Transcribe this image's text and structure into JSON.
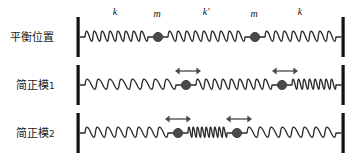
{
  "figure": {
    "title_alt": "Two-mass three-spring coupled oscillator normal modes",
    "width": 361,
    "height": 160,
    "background": "#ffffff",
    "colors": {
      "wall": "#111111",
      "spring": "#2b2b2b",
      "mass": "#4a4a4a",
      "arrow": "#4a4a4a",
      "text": "#1a1a1a"
    }
  },
  "rows": [
    {
      "id": "equilibrium",
      "label": "平衡位置",
      "label_main": "平衡位置",
      "label_sub": "",
      "baseline_y": 37,
      "masses": [
        {
          "name": "mass-left",
          "cx": 158,
          "r": 4.6,
          "label": "m",
          "label_x": 157,
          "label_y": 17,
          "arrow": null
        },
        {
          "name": "mass-right",
          "cx": 255,
          "r": 4.6,
          "label": "m",
          "label_x": 254,
          "label_y": 17,
          "arrow": null
        }
      ],
      "springs": [
        {
          "name": "spring-left",
          "x1": 80,
          "x2": 153,
          "coils": 8,
          "label": "k",
          "label_x": 115,
          "label_y": 15
        },
        {
          "name": "spring-middle",
          "x1": 163,
          "x2": 250,
          "coils": 9,
          "label": "k'",
          "label_x": 206,
          "label_y": 15
        },
        {
          "name": "spring-right",
          "x1": 260,
          "x2": 341,
          "coils": 8,
          "label": "k",
          "label_x": 300,
          "label_y": 15
        }
      ]
    },
    {
      "id": "normal-mode-1",
      "label": "简正模1",
      "label_main": "简正模",
      "label_sub": "1",
      "baseline_y": 85,
      "masses": [
        {
          "name": "mass-left",
          "cx": 186,
          "r": 4.6,
          "label": "",
          "label_x": 0,
          "label_y": 0,
          "arrow": {
            "name": "displacement-arrow-left",
            "x1": 175,
            "x2": 201,
            "y": 71,
            "direction": "both"
          }
        },
        {
          "name": "mass-right",
          "cx": 282,
          "r": 4.6,
          "label": "",
          "label_x": 0,
          "label_y": 0,
          "arrow": {
            "name": "displacement-arrow-right",
            "x1": 272,
            "x2": 298,
            "y": 71,
            "direction": "both"
          }
        }
      ],
      "springs": [
        {
          "name": "spring-left",
          "x1": 80,
          "x2": 181,
          "coils": 8,
          "label": "",
          "label_x": 0,
          "label_y": 0
        },
        {
          "name": "spring-middle",
          "x1": 191,
          "x2": 277,
          "coils": 9,
          "label": "",
          "label_x": 0,
          "label_y": 0
        },
        {
          "name": "spring-right",
          "x1": 287,
          "x2": 341,
          "coils": 8,
          "label": "",
          "label_x": 0,
          "label_y": 0
        }
      ]
    },
    {
      "id": "normal-mode-2",
      "label": "简正模2",
      "label_main": "简正模",
      "label_sub": "2",
      "baseline_y": 133,
      "masses": [
        {
          "name": "mass-left",
          "cx": 178,
          "r": 4.6,
          "label": "",
          "label_x": 0,
          "label_y": 0,
          "arrow": {
            "name": "displacement-arrow-left",
            "x1": 165,
            "x2": 191,
            "y": 119,
            "direction": "both"
          }
        },
        {
          "name": "mass-right",
          "cx": 237,
          "r": 4.6,
          "label": "",
          "label_x": 0,
          "label_y": 0,
          "arrow": {
            "name": "displacement-arrow-right",
            "x1": 226,
            "x2": 252,
            "y": 119,
            "direction": "both"
          }
        }
      ],
      "springs": [
        {
          "name": "spring-left",
          "x1": 80,
          "x2": 173,
          "coils": 8,
          "label": "",
          "label_x": 0,
          "label_y": 0
        },
        {
          "name": "spring-middle",
          "x1": 183,
          "x2": 232,
          "coils": 9,
          "label": "",
          "label_x": 0,
          "label_y": 0
        },
        {
          "name": "spring-right",
          "x1": 242,
          "x2": 341,
          "coils": 8,
          "label": "",
          "label_x": 0,
          "label_y": 0
        }
      ]
    }
  ],
  "walls": [
    {
      "name": "wall-left",
      "x": 76.5,
      "width": 3.2
    },
    {
      "name": "wall-right",
      "x": 341.5,
      "width": 3.2
    }
  ],
  "wall_rows": [
    {
      "name": "wall-row-equilibrium",
      "y": 17,
      "height": 40
    },
    {
      "name": "wall-row-mode1",
      "y": 65,
      "height": 40
    },
    {
      "name": "wall-row-mode2",
      "y": 113,
      "height": 40
    }
  ],
  "label_positions": [
    {
      "name": "row-label-equilibrium",
      "x": 10,
      "y": 41
    },
    {
      "name": "row-label-mode1",
      "x": 16,
      "y": 89
    },
    {
      "name": "row-label-mode2",
      "x": 16,
      "y": 137
    }
  ]
}
